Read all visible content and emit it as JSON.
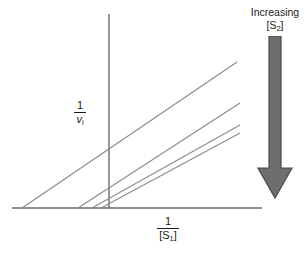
{
  "figure": {
    "kind": "lineweaver-burk-double-reciprocal-plot",
    "background_color": "#ffffff",
    "axis_color": "#6b6b6b",
    "line_color": "#8a8a8a",
    "text_color": "#1a1a1a"
  },
  "axes": {
    "y_label": {
      "numerator": "1",
      "denominator": "v",
      "denominator_sub": "i"
    },
    "x_label": {
      "numerator": "1",
      "denominator": "[S",
      "denominator_sub": "1",
      "denominator_tail": "]"
    },
    "y_axis": {
      "x": 109,
      "y_top": 14,
      "y_bottom": 208
    },
    "x_axis": {
      "y": 208,
      "x_left": 12,
      "x_right": 262
    }
  },
  "legend": {
    "line1": "Increasing",
    "line2_prefix": "[S",
    "line2_sub": "2",
    "line2_suffix": "]",
    "arrow_direction": "down",
    "arrow_color": "#6e6e6e",
    "arrow_edge_color": "#4a4a4a"
  },
  "chart_data": {
    "type": "line",
    "title": "",
    "xlabel": "1/[S1]",
    "ylabel": "1/vi",
    "grid": false,
    "legend_position": "right",
    "annotations": [
      "Increasing [S2]"
    ],
    "axis_note": "Unscaled schematic axes; values are pixel-space coordinates of the drawn segments.",
    "series": [
      {
        "name": "lowest [S2]",
        "comment": "leftmost line, shallowest slope, largest negative x-intercept",
        "x_intercept": 22,
        "points": [
          [
            22,
            208
          ],
          [
            237,
            62
          ]
        ],
        "slope": -0.679
      },
      {
        "name": "mid-low [S2]",
        "comment": "second line from left",
        "x_intercept": 78,
        "points": [
          [
            78,
            208
          ],
          [
            240,
            103
          ]
        ],
        "slope": -0.648
      },
      {
        "name": "mid-high [S2]",
        "comment": "third line, near-parallel to fourth",
        "x_intercept": 92,
        "points": [
          [
            92,
            208
          ],
          [
            240,
            125
          ]
        ],
        "slope": -0.561
      },
      {
        "name": "highest [S2]",
        "comment": "rightmost line, smallest intercept",
        "x_intercept": 101,
        "points": [
          [
            101,
            208
          ],
          [
            240,
            133
          ]
        ],
        "slope": -0.54
      }
    ]
  }
}
